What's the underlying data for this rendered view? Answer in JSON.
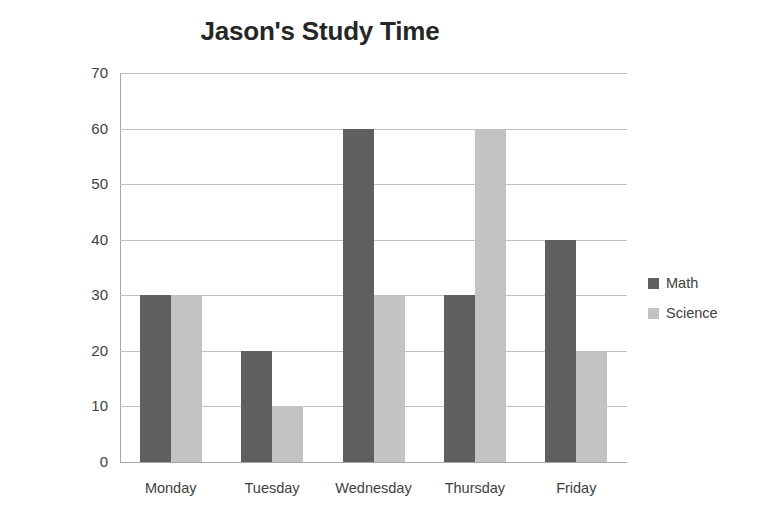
{
  "chart_data": {
    "type": "bar",
    "title": "Jason's Study Time",
    "xlabel": "",
    "ylabel": "Study Time (minutes)",
    "categories": [
      "Monday",
      "Tuesday",
      "Wednesday",
      "Thursday",
      "Friday"
    ],
    "series": [
      {
        "name": "Math",
        "values": [
          30,
          20,
          60,
          30,
          40
        ],
        "color": "#5f5f5f"
      },
      {
        "name": "Science",
        "values": [
          30,
          10,
          30,
          60,
          20
        ],
        "color": "#c3c3c3"
      }
    ],
    "ylim": [
      0,
      70
    ],
    "yticks": [
      0,
      10,
      20,
      30,
      40,
      50,
      60,
      70
    ],
    "ytick_labels": [
      "0",
      "10",
      "20",
      "30",
      "40",
      "50",
      "60",
      "70"
    ],
    "grid": "horizontal",
    "legend_position": "right"
  }
}
